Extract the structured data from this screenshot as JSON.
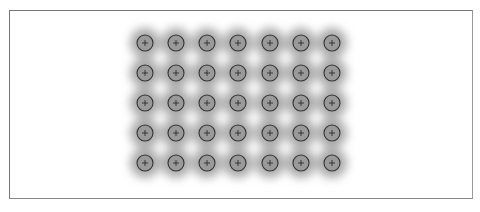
{
  "figure": {
    "grid": {
      "columns": 7,
      "rows": 5
    },
    "column_x": [
      145,
      176,
      207,
      238,
      270,
      301,
      332
    ],
    "row_y": [
      43,
      73,
      103,
      133,
      163
    ],
    "spot_radius": 8,
    "colors": {
      "spot_fill": "#9a9a9a",
      "spot_stroke": "#333333",
      "halo": "#8c8c8c",
      "frame": "#777777"
    }
  }
}
